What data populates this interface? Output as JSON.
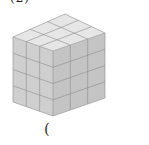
{
  "figure": {
    "label_fragment": "(2)",
    "dimensions": {
      "width_cubes": 3,
      "depth_cubes": 3,
      "height_cubes": 4
    },
    "colors": {
      "top_face": "#e6e6e6",
      "left_face": "#cfcfcf",
      "right_face": "#c4c4c4",
      "grid_lines": "#8c8c8c"
    }
  },
  "answer_blank": {
    "open_paren": "("
  }
}
